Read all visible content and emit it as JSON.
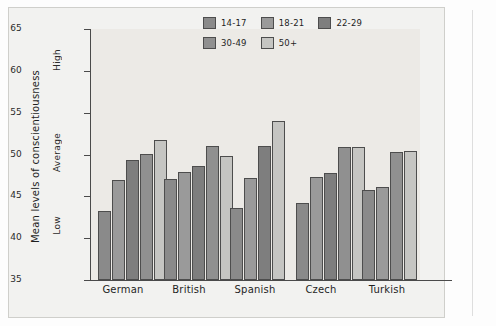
{
  "chart_data": {
    "type": "bar",
    "title": "",
    "xlabel": "",
    "ylabel": "Mean levels of conscientiousness",
    "ylim": [
      35,
      65
    ],
    "yticks": [
      35,
      40,
      45,
      50,
      55,
      60,
      65
    ],
    "ytick_labels": [
      "35",
      "40",
      "45",
      "50",
      "55",
      "60",
      "65"
    ],
    "y_band_labels": [
      {
        "text": "High",
        "value": 60
      },
      {
        "text": "Average",
        "value": 50
      },
      {
        "text": "Low",
        "value": 40
      }
    ],
    "grid": false,
    "legend_position": "top-right",
    "categories": [
      "German",
      "British",
      "Spanish",
      "Czech",
      "Turkish"
    ],
    "series": [
      {
        "name": "14-17",
        "color": "#8a8a8a",
        "values": [
          43.3,
          47.1,
          43.6,
          44.2,
          45.7
        ]
      },
      {
        "name": "18-21",
        "color": "#9a9a9a",
        "values": [
          47.0,
          47.9,
          47.2,
          47.3,
          46.1
        ]
      },
      {
        "name": "22-29",
        "color": "#7e7e7e",
        "values": [
          49.4,
          48.6,
          51.0,
          47.8,
          null
        ]
      },
      {
        "name": "30-49",
        "color": "#909090",
        "values": [
          50.1,
          51.0,
          null,
          50.9,
          50.3
        ]
      },
      {
        "name": "50+",
        "color": "#c5c5c2",
        "values": [
          51.7,
          49.8,
          54.0,
          50.9,
          50.4
        ]
      }
    ]
  },
  "legend": {
    "row1": [
      {
        "label": "14-17",
        "color": "#8a8a8a"
      },
      {
        "label": "18-21",
        "color": "#9a9a9a"
      },
      {
        "label": "22-29",
        "color": "#7e7e7e"
      }
    ],
    "row2": [
      {
        "label": "30-49",
        "color": "#909090"
      },
      {
        "label": "50+",
        "color": "#c5c5c2"
      }
    ]
  },
  "colors": {
    "plot_background": "#eceae6",
    "page_background": "#f2f2f0",
    "axis": "#4a4a4a",
    "bar_outline": "#4d4d4d",
    "text": "#1f1f1f"
  }
}
